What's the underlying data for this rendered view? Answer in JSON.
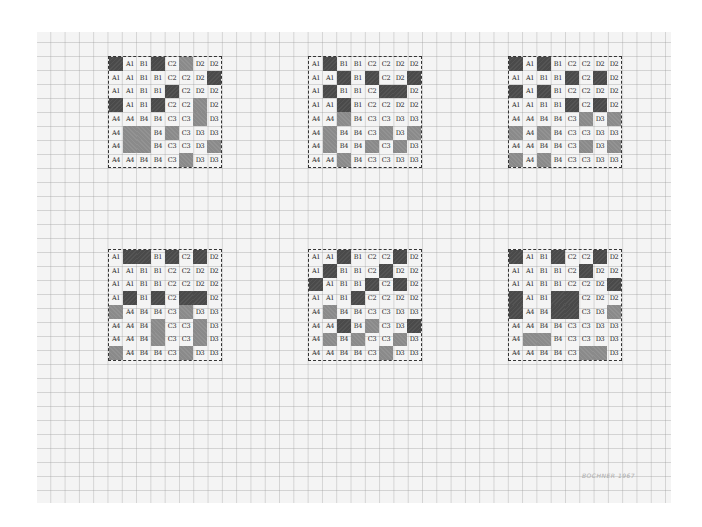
{
  "artwork": {
    "signature": "BOCHNER 1967",
    "fill_colors": {
      "dark": "#4a4a4a",
      "gray": "#8a8a8a",
      "paper": "#f4f4f4"
    }
  },
  "grids": [
    {
      "name": "grid-1",
      "x": 108,
      "y": 56,
      "rows": [
        [
          "#D",
          "A1",
          "B1",
          "#D",
          "C2",
          "#G",
          "D2",
          "D2"
        ],
        [
          "A1",
          "A1",
          "B1",
          "B1",
          "C2",
          "C2",
          "D2",
          "#D"
        ],
        [
          "A1",
          "A1",
          "B1",
          "B1",
          "#D",
          "C2",
          "D2",
          "D2"
        ],
        [
          "#D",
          "A1",
          "B1",
          "#D",
          "C2",
          "C2",
          "#G",
          "D2"
        ],
        [
          "A4",
          "A4",
          "B4",
          "B4",
          "C3",
          "C3",
          "#G",
          "D3"
        ],
        [
          "A4",
          "#G",
          "#G",
          "B4",
          "#G",
          "C3",
          "D3",
          "D3"
        ],
        [
          "A4",
          "#G",
          "#G",
          "B4",
          "C3",
          "C3",
          "D3",
          "#G"
        ],
        [
          "A4",
          "A4",
          "B4",
          "B4",
          "C3",
          "#G",
          "D3",
          "D3"
        ]
      ]
    },
    {
      "name": "grid-2",
      "x": 308,
      "y": 56,
      "rows": [
        [
          "A1",
          "#D",
          "B1",
          "B1",
          "C2",
          "C2",
          "D2",
          "D2"
        ],
        [
          "A1",
          "A1",
          "#D",
          "B1",
          "#D",
          "C2",
          "D2",
          "#D"
        ],
        [
          "A1",
          "#D",
          "B1",
          "B1",
          "C2",
          "#D",
          "#D",
          "D2"
        ],
        [
          "A1",
          "A1",
          "#D",
          "B1",
          "C2",
          "C2",
          "D2",
          "D2"
        ],
        [
          "A4",
          "A4",
          "#G",
          "B4",
          "C3",
          "C3",
          "D3",
          "D3"
        ],
        [
          "A4",
          "#G",
          "B4",
          "B4",
          "C3",
          "#G",
          "D3",
          "#G"
        ],
        [
          "A4",
          "#G",
          "B4",
          "B4",
          "#G",
          "C3",
          "#G",
          "D3"
        ],
        [
          "A4",
          "A4",
          "#G",
          "B4",
          "C3",
          "C3",
          "D3",
          "D3"
        ]
      ]
    },
    {
      "name": "grid-3",
      "x": 508,
      "y": 56,
      "rows": [
        [
          "#D",
          "A1",
          "#D",
          "B1",
          "C2",
          "C2",
          "D2",
          "D2"
        ],
        [
          "A1",
          "A1",
          "B1",
          "B1",
          "#D",
          "C2",
          "#D",
          "D2"
        ],
        [
          "#D",
          "A1",
          "#D",
          "B1",
          "C2",
          "C2",
          "D2",
          "D2"
        ],
        [
          "A1",
          "A1",
          "B1",
          "B1",
          "#D",
          "C2",
          "#D",
          "D2"
        ],
        [
          "A4",
          "A4",
          "B4",
          "B4",
          "C3",
          "#G",
          "D3",
          "#G"
        ],
        [
          "#G",
          "A4",
          "#G",
          "B4",
          "C3",
          "C3",
          "D3",
          "D3"
        ],
        [
          "A4",
          "A4",
          "B4",
          "B4",
          "C3",
          "#G",
          "D3",
          "#G"
        ],
        [
          "#G",
          "A4",
          "#G",
          "B4",
          "C3",
          "C3",
          "D3",
          "D3"
        ]
      ]
    },
    {
      "name": "grid-4",
      "x": 108,
      "y": 249,
      "rows": [
        [
          "A1",
          "#D",
          "#D",
          "B1",
          "#D",
          "C2",
          "#D",
          "D2"
        ],
        [
          "A1",
          "A1",
          "B1",
          "B1",
          "C2",
          "C2",
          "D2",
          "D2"
        ],
        [
          "A1",
          "A1",
          "B1",
          "B1",
          "C2",
          "C2",
          "D2",
          "D2"
        ],
        [
          "A1",
          "#D",
          "B1",
          "#D",
          "C2",
          "#D",
          "#D",
          "D2"
        ],
        [
          "#G",
          "A4",
          "B4",
          "B4",
          "C3",
          "#G",
          "D3",
          "D3"
        ],
        [
          "A4",
          "A4",
          "B4",
          "#G",
          "C3",
          "C3",
          "#G",
          "D3"
        ],
        [
          "A4",
          "A4",
          "B4",
          "#G",
          "C3",
          "C3",
          "#G",
          "D3"
        ],
        [
          "#G",
          "A4",
          "B4",
          "B4",
          "C3",
          "#G",
          "D3",
          "D3"
        ]
      ]
    },
    {
      "name": "grid-5",
      "x": 308,
      "y": 249,
      "rows": [
        [
          "A1",
          "A1",
          "#D",
          "B1",
          "C2",
          "C2",
          "#D",
          "D2"
        ],
        [
          "A1",
          "#D",
          "B1",
          "B1",
          "C2",
          "#D",
          "D2",
          "D2"
        ],
        [
          "#D",
          "A1",
          "B1",
          "B1",
          "#D",
          "C2",
          "#D",
          "D2"
        ],
        [
          "A1",
          "A1",
          "B1",
          "#D",
          "C2",
          "C2",
          "D2",
          "D2"
        ],
        [
          "A4",
          "#G",
          "B4",
          "B4",
          "C3",
          "C3",
          "D3",
          "D3"
        ],
        [
          "A4",
          "A4",
          "#D",
          "B4",
          "#G",
          "C3",
          "D3",
          "#D"
        ],
        [
          "A4",
          "#G",
          "B4",
          "#G",
          "C3",
          "C3",
          "#G",
          "D3"
        ],
        [
          "A4",
          "A4",
          "B4",
          "B4",
          "C3",
          "#G",
          "D3",
          "D3"
        ]
      ]
    },
    {
      "name": "grid-6",
      "x": 508,
      "y": 249,
      "rows": [
        [
          "#D",
          "A1",
          "B1",
          "#D",
          "C2",
          "C2",
          "#D",
          "D2"
        ],
        [
          "A1",
          "A1",
          "B1",
          "B1",
          "C2",
          "#D",
          "D2",
          "D2"
        ],
        [
          "A1",
          "A1",
          "B1",
          "B1",
          "C2",
          "C2",
          "D2",
          "#D"
        ],
        [
          "#D",
          "A1",
          "B1",
          "#D",
          "#D",
          "C2",
          "D2",
          "D2"
        ],
        [
          "#D",
          "A4",
          "B4",
          "#D",
          "#D",
          "C3",
          "D3",
          "#G"
        ],
        [
          "A4",
          "A4",
          "B4",
          "B4",
          "C3",
          "C3",
          "D3",
          "D3"
        ],
        [
          "A4",
          "#G",
          "#G",
          "B4",
          "C3",
          "C3",
          "D3",
          "D3"
        ],
        [
          "A4",
          "A4",
          "B4",
          "B4",
          "C3",
          "#G",
          "#G",
          "D3"
        ]
      ]
    }
  ]
}
